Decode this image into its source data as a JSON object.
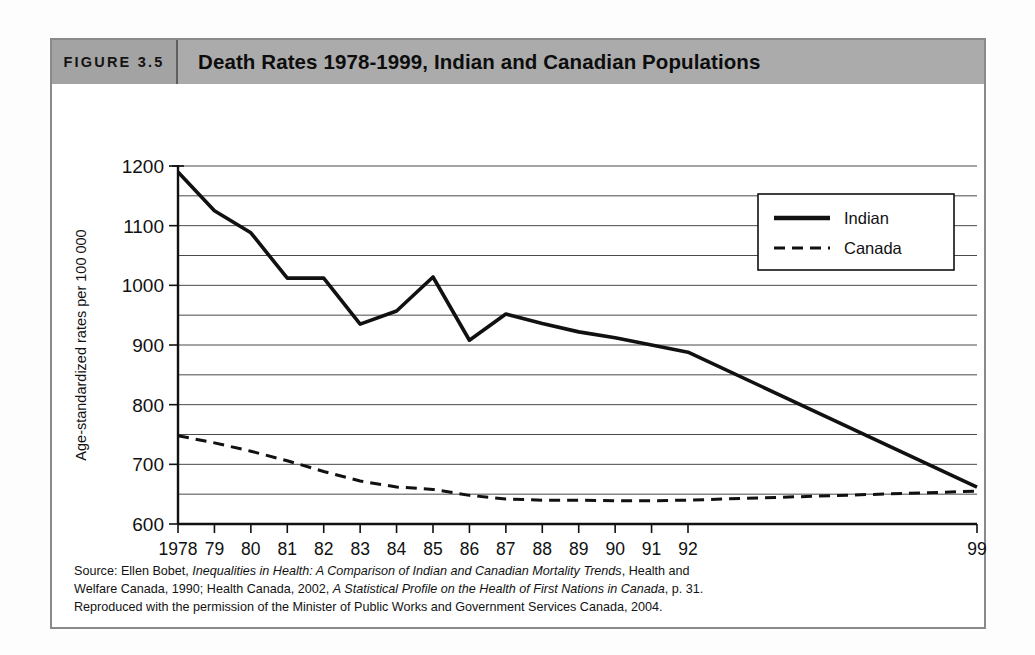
{
  "figure": {
    "label": "FIGURE 3.5",
    "title": "Death Rates 1978-1999, Indian and Canadian Populations"
  },
  "source": {
    "line1_a": "Source: Ellen Bobet, ",
    "line1_italic": "Inequalities in Health: A Comparison of Indian and Canadian Mortality Trends",
    "line1_b": ", Health and",
    "line2_a": "Welfare Canada, 1990; Health Canada, 2002, ",
    "line2_italic": "A Statistical Profile on the Health of First Nations in Canada",
    "line2_b": ", p. 31.",
    "line3": "Reproduced with the permission of the Minister of Public Works and Government Services Canada, 2004."
  },
  "chart_data": {
    "type": "line",
    "title": "Death Rates 1978-1999, Indian and Canadian Populations",
    "xlabel": "Year",
    "ylabel": "Age-standardized rates per 100 000",
    "ylim": [
      600,
      1200
    ],
    "y_major_ticks": [
      600,
      700,
      800,
      900,
      1000,
      1100,
      1200
    ],
    "y_minor_ticks": [
      650,
      750,
      850,
      950,
      1050,
      1150
    ],
    "y_major_labels": [
      "600",
      "700",
      "800",
      "900",
      "1000",
      "1100",
      "1200"
    ],
    "grid": true,
    "grid_orientation": "horizontal",
    "x_tick_labels": [
      "1978",
      "79",
      "80",
      "81",
      "82",
      "83",
      "84",
      "85",
      "86",
      "87",
      "88",
      "89",
      "90",
      "91",
      "92",
      "99"
    ],
    "x_axis_note": "years 1978-1992 evenly spaced, then a gap, with 1999 plotted at the far right",
    "legend_position": "top-right",
    "series": [
      {
        "name": "Indian",
        "style": "solid",
        "color": "#111111",
        "x": [
          "1978",
          "79",
          "80",
          "81",
          "82",
          "83",
          "84",
          "85",
          "86",
          "87",
          "88",
          "89",
          "90",
          "91",
          "92",
          "99"
        ],
        "values": [
          1190,
          1125,
          1088,
          1012,
          1012,
          935,
          957,
          1014,
          908,
          952,
          936,
          922,
          912,
          900,
          888,
          662
        ]
      },
      {
        "name": "Canada",
        "style": "dashed",
        "color": "#111111",
        "x": [
          "1978",
          "79",
          "80",
          "81",
          "82",
          "83",
          "84",
          "85",
          "86",
          "87",
          "88",
          "89",
          "90",
          "91",
          "92",
          "99"
        ],
        "values": [
          748,
          736,
          722,
          706,
          688,
          672,
          662,
          658,
          648,
          642,
          640,
          640,
          639,
          639,
          640,
          655
        ]
      }
    ]
  },
  "legend": {
    "items": [
      {
        "label": "Indian",
        "style": "solid"
      },
      {
        "label": "Canada",
        "style": "dashed"
      }
    ]
  }
}
